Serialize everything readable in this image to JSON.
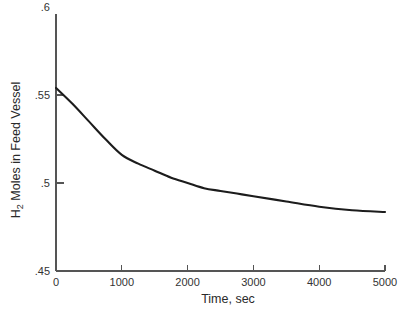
{
  "chart_data": {
    "type": "line",
    "title": "",
    "xlabel": "Time, sec",
    "ylabel": "H2 Moles in Feed Vessel",
    "ylabel_prefix": "H",
    "ylabel_subscript": "2",
    "ylabel_suffix": " Moles in Feed Vessel",
    "xlim": [
      0,
      5000
    ],
    "ylim": [
      0.45,
      0.6
    ],
    "xticks": [
      0,
      1000,
      2000,
      3000,
      4000,
      5000
    ],
    "xticklabels": [
      "0",
      "1000",
      "2000",
      "3000",
      "4000",
      "5000"
    ],
    "yticks": [
      0.45,
      0.5,
      0.55,
      0.6
    ],
    "yticklabels": [
      ".45",
      ".5",
      ".55",
      ".6"
    ],
    "grid": false,
    "legend": false,
    "series": [
      {
        "name": "H2 moles",
        "x": [
          0,
          250,
          500,
          750,
          1000,
          1250,
          1500,
          1750,
          2000,
          2250,
          2500,
          2750,
          3000,
          3500,
          4000,
          4500,
          5000
        ],
        "y": [
          0.554,
          0.545,
          0.535,
          0.525,
          0.516,
          0.511,
          0.507,
          0.503,
          0.5,
          0.497,
          0.4955,
          0.494,
          0.4925,
          0.4895,
          0.4865,
          0.4845,
          0.4835
        ],
        "color": "#1c1c1c"
      }
    ]
  },
  "colors": {
    "axis": "#555555",
    "curve": "#1c1c1c",
    "background": "#ffffff",
    "text": "#333333"
  }
}
